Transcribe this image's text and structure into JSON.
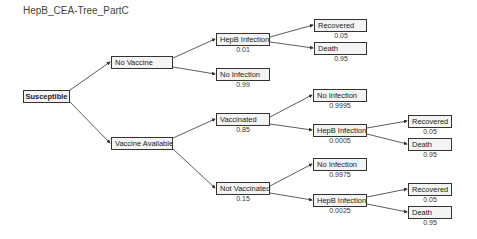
{
  "title": "HepB_CEA-Tree_PartC",
  "tree": {
    "root": {
      "label": "Susceptible"
    },
    "no_vaccine": {
      "label": "No Vaccine"
    },
    "vaccine_available": {
      "label": "Vaccine Available"
    },
    "nv_hepb": {
      "label": "HepB Infection",
      "prob": "0.01"
    },
    "nv_noinf": {
      "label": "No Infection",
      "prob": "0.99"
    },
    "nv_recovered": {
      "label": "Recovered",
      "prob": "0.05"
    },
    "nv_death": {
      "label": "Death",
      "prob": "0.95"
    },
    "vaccinated": {
      "label": "Vaccinated",
      "prob": "0.85"
    },
    "v_noinf": {
      "label": "No Infection",
      "prob": "0.9995"
    },
    "v_hepb": {
      "label": "HepB Infection",
      "prob": "0.0005"
    },
    "v_recovered": {
      "label": "Recovered",
      "prob": "0.05"
    },
    "v_death": {
      "label": "Death",
      "prob": "0.95"
    },
    "not_vaccinated": {
      "label": "Not Vaccinated",
      "prob": "0.15"
    },
    "nvac_noinf": {
      "label": "No Infection",
      "prob": "0.9975"
    },
    "nvac_hepb": {
      "label": "HepB Infection",
      "prob": "0.0025"
    },
    "nvac_recovered": {
      "label": "Recovered",
      "prob": "0.05"
    },
    "nvac_death": {
      "label": "Death",
      "prob": "0.95"
    }
  }
}
